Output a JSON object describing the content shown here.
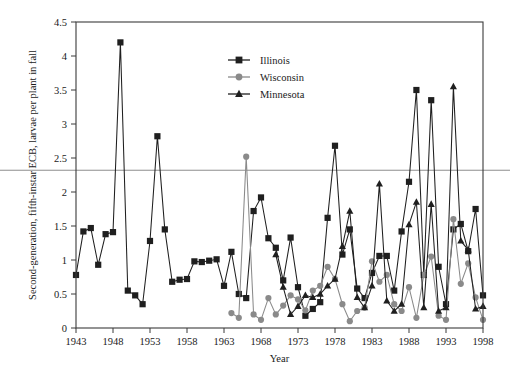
{
  "chart_data": {
    "type": "line",
    "title": "",
    "xlabel": "Year",
    "ylabel": "Second-generation, fifth-instar ECB, larvae per plant in fall",
    "xlim": [
      1943,
      1998
    ],
    "ylim": [
      0,
      4.5
    ],
    "xticks": [
      1943,
      1948,
      1953,
      1958,
      1963,
      1968,
      1973,
      1978,
      1983,
      1988,
      1993,
      1998
    ],
    "yticks": [
      0,
      0.5,
      1,
      1.5,
      2,
      2.5,
      3,
      3.5,
      4,
      4.5
    ],
    "xtick_labels": [
      "1943",
      "1948",
      "1953",
      "1958",
      "1963",
      "1968",
      "1973",
      "1978",
      "1983",
      "1988",
      "1993",
      "1998"
    ],
    "ytick_labels": [
      "0",
      "0.5",
      "1",
      "1.5",
      "2",
      "2.5",
      "3",
      "3.5",
      "4",
      "4.5"
    ],
    "grid": false,
    "legend_position": "top-center",
    "series": [
      {
        "name": "Illinois",
        "color": "#1f1f1f",
        "marker": "square",
        "x": [
          1943,
          1944,
          1945,
          1946,
          1947,
          1948,
          1949,
          1950,
          1951,
          1952,
          1953,
          1954,
          1955,
          1956,
          1957,
          1958,
          1959,
          1960,
          1961,
          1962,
          1963,
          1964,
          1965,
          1966,
          1967,
          1968,
          1969,
          1970,
          1971,
          1972,
          1973,
          1974,
          1975,
          1976,
          1977,
          1978,
          1979,
          1980,
          1981,
          1982,
          1983,
          1984,
          1985,
          1986,
          1987,
          1988,
          1989,
          1990,
          1991,
          1992,
          1993,
          1994,
          1995,
          1996,
          1997,
          1998
        ],
        "values": [
          0.78,
          1.42,
          1.47,
          0.93,
          1.38,
          1.41,
          4.2,
          0.55,
          0.48,
          0.35,
          1.28,
          2.82,
          1.45,
          0.68,
          0.71,
          0.72,
          0.98,
          0.97,
          0.99,
          1.01,
          0.62,
          1.12,
          0.5,
          0.44,
          1.72,
          1.92,
          1.32,
          1.18,
          0.7,
          1.33,
          0.6,
          0.18,
          0.28,
          0.38,
          1.62,
          2.68,
          1.08,
          1.45,
          0.58,
          0.44,
          0.81,
          1.06,
          1.06,
          0.55,
          1.42,
          2.15,
          3.5,
          0.78,
          3.35,
          0.9,
          0.35,
          1.45,
          1.53,
          1.13,
          1.75,
          0.48
        ]
      },
      {
        "name": "Wisconsin",
        "color": "#8a8a8a",
        "marker": "circle",
        "x": [
          1964,
          1965,
          1966,
          1967,
          1968,
          1969,
          1970,
          1971,
          1972,
          1973,
          1974,
          1975,
          1976,
          1977,
          1978,
          1979,
          1980,
          1981,
          1982,
          1983,
          1984,
          1985,
          1986,
          1987,
          1988,
          1989,
          1990,
          1991,
          1992,
          1993,
          1994,
          1995,
          1996,
          1997,
          1998
        ],
        "values": [
          0.22,
          0.15,
          2.52,
          0.2,
          0.12,
          0.44,
          0.2,
          0.33,
          0.48,
          0.42,
          0.26,
          0.55,
          0.62,
          0.9,
          0.72,
          0.35,
          0.1,
          0.25,
          0.3,
          0.98,
          0.68,
          0.78,
          0.35,
          0.25,
          0.6,
          0.15,
          0.78,
          1.05,
          0.18,
          0.12,
          1.6,
          0.65,
          0.95,
          0.45,
          0.12
        ]
      },
      {
        "name": "Minnesota",
        "color": "#1f1f1f",
        "marker": "triangle",
        "x": [
          1970,
          1971,
          1972,
          1973,
          1974,
          1975,
          1976,
          1977,
          1978,
          1979,
          1980,
          1981,
          1982,
          1983,
          1984,
          1985,
          1986,
          1987,
          1988,
          1989,
          1990,
          1991,
          1992,
          1993,
          1994,
          1995,
          1996,
          1997,
          1998
        ],
        "values": [
          1.08,
          0.6,
          0.2,
          0.32,
          0.48,
          0.45,
          0.5,
          0.62,
          0.72,
          1.2,
          1.72,
          0.45,
          0.3,
          0.62,
          2.12,
          0.4,
          0.25,
          0.35,
          1.52,
          1.85,
          0.3,
          1.82,
          0.25,
          0.3,
          3.55,
          1.28,
          1.15,
          0.28,
          0.32
        ]
      }
    ],
    "annotations": [
      {
        "name": "horizontal-artifact-line",
        "y_value": 2.32,
        "color": "#8e8e8e",
        "full_width": true
      }
    ]
  },
  "legend": {
    "items": [
      {
        "label": "Illinois",
        "marker": "square",
        "color": "#1f1f1f"
      },
      {
        "label": "Wisconsin",
        "marker": "circle",
        "color": "#8a8a8a"
      },
      {
        "label": "Minnesota",
        "marker": "triangle",
        "color": "#1f1f1f"
      }
    ]
  }
}
